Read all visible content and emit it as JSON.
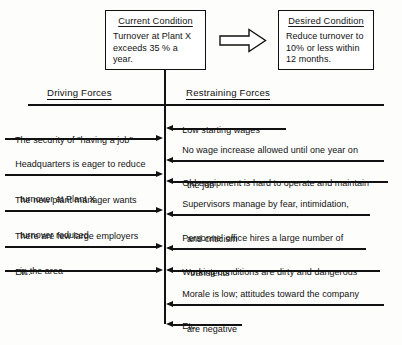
{
  "diagram": {
    "current_condition": {
      "heading": "Current Condition",
      "line1": "Turnover at Plant X",
      "line2": "exceeds 35 % a year."
    },
    "desired_condition": {
      "heading": "Desired Condition",
      "line1": "Reduce turnover to",
      "line2": "10% or less within",
      "line3": "12 months."
    },
    "transition_arrow": "block-arrow-right",
    "columns": {
      "driving": "Driving Forces",
      "restraining": "Restraining Forces"
    },
    "driving_forces": [
      {
        "line1": "The security of \"having a job\"",
        "line2": ""
      },
      {
        "line1": "Headquarters is eager to reduce",
        "line2": "turnover at Plant X"
      },
      {
        "line1": "The new plant manager wants",
        "line2": "turnover reduced"
      },
      {
        "line1": "There are few large employers",
        "line2": "in the area"
      },
      {
        "line1": "Etc.",
        "line2": ""
      }
    ],
    "restraining_forces": [
      {
        "line1": "Low starting wages",
        "line2": ""
      },
      {
        "line1": "No wage increase allowed until one year on",
        "line2": "the job"
      },
      {
        "line1": "Old equipment is hard to operate and maintain",
        "line2": ""
      },
      {
        "line1": "Supervisors manage by fear, intimidation,",
        "line2": "and criticism"
      },
      {
        "line1": "Personnel office hires a large number of",
        "line2": "\"transients\""
      },
      {
        "line1": "Working conditions are dirty and dangerous",
        "line2": ""
      },
      {
        "line1": "Morale is low; attitudes toward the company",
        "line2": "are negative"
      },
      {
        "line1": "Etc.",
        "line2": ""
      }
    ],
    "colors": {
      "ink": "#111111",
      "paper": "#fdfdfc"
    }
  }
}
